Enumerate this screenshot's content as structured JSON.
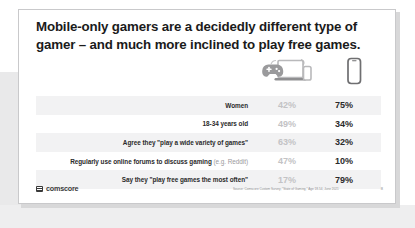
{
  "slide": {
    "title": "Mobile-only gamers are a decidedly different type of gamer – and much more inclined to play free games.",
    "columns": {
      "col_a_icon": "gamepad-laptop-phone-icon",
      "col_b_icon": "smartphone-icon"
    },
    "rows": [
      {
        "label": "Women",
        "sub": "",
        "col_a": "42%",
        "col_b": "75%"
      },
      {
        "label": "18-34 years old",
        "sub": "",
        "col_a": "49%",
        "col_b": "34%"
      },
      {
        "label": "Agree they \"play a wide variety of games\"",
        "sub": "",
        "col_a": "63%",
        "col_b": "32%"
      },
      {
        "label": "Regularly use online forums to discuss gaming",
        "sub": "(e.g. Reddit)",
        "col_a": "47%",
        "col_b": "10%"
      },
      {
        "label": "Say they \"play free games the most often\"",
        "sub": "",
        "col_a": "17%",
        "col_b": "79%"
      }
    ],
    "footer": {
      "logo_text": "comscore",
      "source": "Source: Comscore Custom Survey, \"State of Gaming,\" Age 18-54, June 2021",
      "page": "8"
    },
    "colors": {
      "value_muted": "#c3c3c5",
      "value_strong": "#2b2b2b",
      "row_shade": "#f2f2f3",
      "title": "#1b1b1b"
    }
  }
}
